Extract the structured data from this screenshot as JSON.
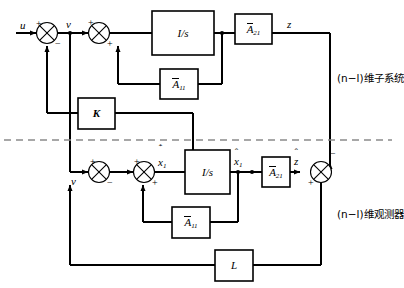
{
  "diagram": {
    "signals": {
      "u": "u",
      "v_top": "v",
      "v_bottom": "v",
      "z": "z",
      "z_hat_base": "z",
      "x1_dot_base": "x",
      "x1_dot_sub": "1",
      "x1_base": "x",
      "x1_sub": "1"
    },
    "blocks": {
      "integrator_top": "I/s",
      "integrator_bottom": "I/s",
      "a21_top_base": "A",
      "a21_top_sub": "21",
      "a11_top_base": "A",
      "a11_top_sub": "11",
      "a21_bottom_base": "A",
      "a21_bottom_sub": "21",
      "a11_bottom_base": "A",
      "a11_bottom_sub": "11",
      "gain_k": "K",
      "gain_l": "L"
    },
    "signs": {
      "sum1_plus": "+",
      "sum1_minus": "−",
      "sum2_plus_top": "+",
      "sum2_plus_bottom": "+",
      "sum3_plus": "+",
      "sum3_minus": "−",
      "sum4_plus_top": "+",
      "sum4_plus_bottom": "+",
      "sum5_minus": "−",
      "sum5_plus": "+"
    },
    "annotations": {
      "subsystem": "(n−l)维子系统",
      "observer": "(n−l)维观测器"
    },
    "colors": {
      "line": "#000000",
      "divider": "#8a8a8a",
      "background": "#ffffff"
    }
  }
}
